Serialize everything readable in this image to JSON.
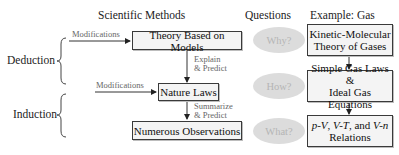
{
  "headers": {
    "methods": "Scientific Methods",
    "questions": "Questions",
    "example": "Example: Gas"
  },
  "side_labels": {
    "deduction": "Deduction",
    "induction": "Induction"
  },
  "methods": {
    "theory": "Theory Based on Models",
    "laws": "Nature Laws",
    "observations": "Numerous Observations",
    "modifications_top": "Modifications",
    "modifications_mid": "Modifications",
    "explain_line1": "Explain",
    "explain_line2": "& Predict",
    "summarize_line1": "Summarize",
    "summarize_line2": "& Predict"
  },
  "questions": {
    "why": "Why?",
    "how": "How?",
    "what": "What?"
  },
  "example": {
    "kinetic_line1": "Kinetic-Molecular",
    "kinetic_line2": "Theory of Gases",
    "simple_line1": "Simple Gas Laws &",
    "simple_line2": "Ideal Gas Equations",
    "relations_pv": "p-V",
    "relations_sep1": ", ",
    "relations_vt": "V-T",
    "relations_and": ", and ",
    "relations_vn": "V-n",
    "relations_line2": "Relations"
  },
  "colors": {
    "box_fill": "#f4f4f4",
    "box_border": "#3a3a3a",
    "ellipse_fill": "#dcdcdc",
    "ellipse_text": "#b5b5b5",
    "annotation_text": "#666666"
  }
}
